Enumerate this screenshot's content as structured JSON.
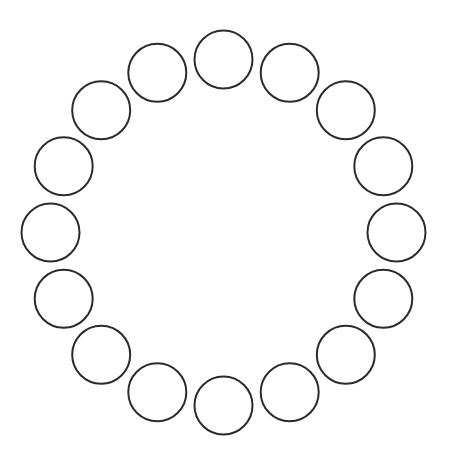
{
  "canvas": {
    "width": 450,
    "height": 468,
    "background_color": "#ffffff",
    "title": "Ring of circles diagram"
  },
  "style": {
    "stroke_color": "#2b2b2b",
    "stroke_width": 2,
    "fill_color": "#ffffff"
  },
  "chart_data": {
    "type": "scatter",
    "title": "",
    "subtitle": "",
    "xlabel": "",
    "ylabel": "",
    "grid": false,
    "legend": null,
    "annotations": [],
    "xlim": [
      0,
      450
    ],
    "ylim": [
      0,
      468
    ],
    "shape": "ring-of-circles",
    "node_count": 16,
    "node_radius": 29,
    "ring_center": [
      223.5,
      232.5
    ],
    "ring_radius": 173,
    "start_angle_deg": -90,
    "angle_step_deg": 22.5,
    "bounding_box": {
      "x_min": 21,
      "y_min": 27,
      "x_max": 426,
      "y_max": 438
    },
    "categories": [
      "node-01",
      "node-02",
      "node-03",
      "node-04",
      "node-05",
      "node-06",
      "node-07",
      "node-08",
      "node-09",
      "node-10",
      "node-11",
      "node-12",
      "node-13",
      "node-14",
      "node-15",
      "node-16"
    ],
    "nodes": [
      {
        "id": "node-01",
        "clock_position": "12:00",
        "angle_deg": -90.0,
        "cx": 223.5,
        "cy": 59.5,
        "r": 29
      },
      {
        "id": "node-02",
        "clock_position": "12:45",
        "angle_deg": -67.5,
        "cx": 289.7,
        "cy": 72.7,
        "r": 29
      },
      {
        "id": "node-03",
        "clock_position": "01:30",
        "angle_deg": -45.0,
        "cx": 345.8,
        "cy": 110.2,
        "r": 29
      },
      {
        "id": "node-04",
        "clock_position": "02:15",
        "angle_deg": -22.5,
        "cx": 383.3,
        "cy": 166.3,
        "r": 29
      },
      {
        "id": "node-05",
        "clock_position": "03:00",
        "angle_deg": 0.0,
        "cx": 396.5,
        "cy": 232.5,
        "r": 29
      },
      {
        "id": "node-06",
        "clock_position": "03:45",
        "angle_deg": 22.5,
        "cx": 383.3,
        "cy": 298.7,
        "r": 29
      },
      {
        "id": "node-07",
        "clock_position": "04:30",
        "angle_deg": 45.0,
        "cx": 345.8,
        "cy": 354.8,
        "r": 29
      },
      {
        "id": "node-08",
        "clock_position": "05:15",
        "angle_deg": 67.5,
        "cx": 289.7,
        "cy": 392.3,
        "r": 29
      },
      {
        "id": "node-09",
        "clock_position": "06:00",
        "angle_deg": 90.0,
        "cx": 223.5,
        "cy": 405.5,
        "r": 29
      },
      {
        "id": "node-10",
        "clock_position": "06:45",
        "angle_deg": 112.5,
        "cx": 157.3,
        "cy": 392.3,
        "r": 29
      },
      {
        "id": "node-11",
        "clock_position": "07:30",
        "angle_deg": 135.0,
        "cx": 101.2,
        "cy": 354.8,
        "r": 29
      },
      {
        "id": "node-12",
        "clock_position": "08:15",
        "angle_deg": 157.5,
        "cx": 63.7,
        "cy": 298.7,
        "r": 29
      },
      {
        "id": "node-13",
        "clock_position": "09:00",
        "angle_deg": 180.0,
        "cx": 50.5,
        "cy": 232.5,
        "r": 29
      },
      {
        "id": "node-14",
        "clock_position": "09:45",
        "angle_deg": 202.5,
        "cx": 63.7,
        "cy": 166.3,
        "r": 29
      },
      {
        "id": "node-15",
        "clock_position": "10:30",
        "angle_deg": 225.0,
        "cx": 101.2,
        "cy": 110.2,
        "r": 29
      },
      {
        "id": "node-16",
        "clock_position": "11:15",
        "angle_deg": 247.5,
        "cx": 157.3,
        "cy": 72.7,
        "r": 29
      }
    ],
    "values": [
      1,
      1,
      1,
      1,
      1,
      1,
      1,
      1,
      1,
      1,
      1,
      1,
      1,
      1,
      1,
      1
    ]
  }
}
